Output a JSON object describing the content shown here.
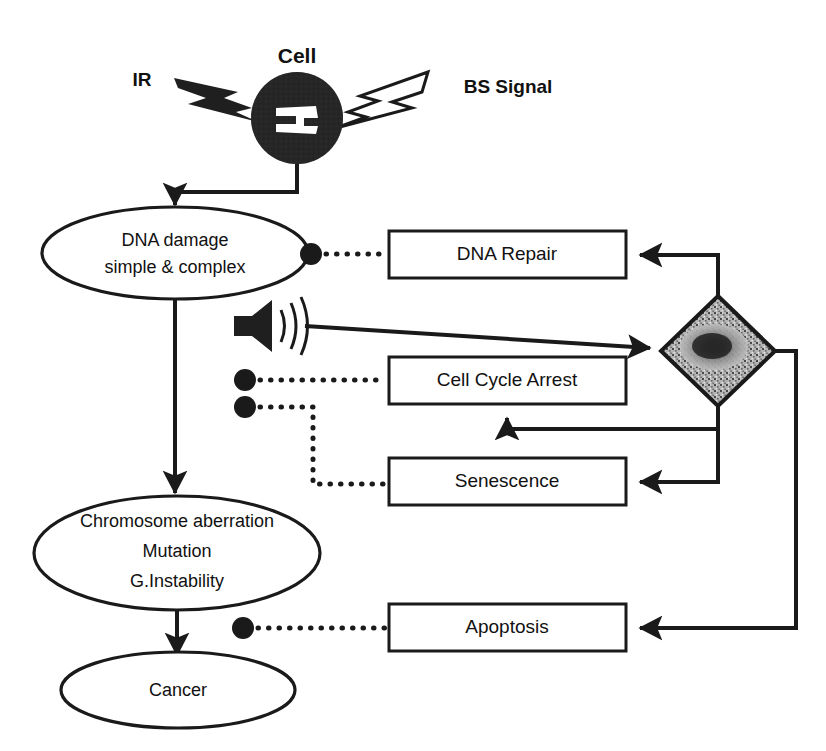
{
  "diagram": {
    "head": {
      "cell_label": "Cell",
      "left_stimulus_label": "IR",
      "right_stimulus_label": "BS Signal",
      "cell_icon": "filled-cell-with-nucleus-icon",
      "left_bolt_icon": "lightning-bolt-filled-icon",
      "right_bolt_icon": "lightning-bolt-outline-icon"
    },
    "nodes": {
      "dna_damage": {
        "line1": "DNA damage",
        "line2": "simple & complex",
        "shape": "ellipse"
      },
      "aberration": {
        "line1": "Chromosome aberration",
        "line2": "Mutation",
        "line3": "G.Instability",
        "shape": "ellipse"
      },
      "cancer": {
        "line1": "Cancer",
        "shape": "ellipse"
      },
      "dna_repair": {
        "label": "DNA Repair",
        "shape": "rect"
      },
      "cell_cycle_arrest": {
        "label": "Cell Cycle Arrest",
        "shape": "rect"
      },
      "senescence": {
        "label": "Senescence",
        "shape": "rect"
      },
      "apoptosis": {
        "label": "Apoptosis",
        "shape": "rect"
      },
      "decision": {
        "label": "",
        "shape": "diamond-textured",
        "icon": "speckled-diamond-icon"
      }
    },
    "icons": {
      "speaker": "speaker-signal-icon"
    },
    "colors": {
      "ink": "#1a1a1a",
      "paper": "#ffffff",
      "diamond_fill": "#9a9a9a",
      "diamond_core": "#2e2e2e",
      "cell_fill": "#262626"
    }
  }
}
